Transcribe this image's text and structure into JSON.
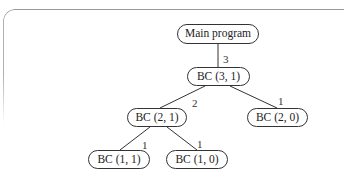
{
  "diagram": {
    "type": "call-tree",
    "nodes": [
      {
        "id": "main",
        "label": "Main program"
      },
      {
        "id": "bc31",
        "label": "BC (3, 1)"
      },
      {
        "id": "bc21",
        "label": "BC (2, 1)"
      },
      {
        "id": "bc20",
        "label": "BC (2, 0)"
      },
      {
        "id": "bc11",
        "label": "BC (1, 1)"
      },
      {
        "id": "bc10",
        "label": "BC (1, 0)"
      }
    ],
    "edges": [
      {
        "from": "main",
        "to": "bc31",
        "label": "3"
      },
      {
        "from": "bc31",
        "to": "bc21",
        "label": "2"
      },
      {
        "from": "bc31",
        "to": "bc20",
        "label": "1"
      },
      {
        "from": "bc21",
        "to": "bc11",
        "label": "1"
      },
      {
        "from": "bc21",
        "to": "bc10",
        "label": "1"
      }
    ],
    "colors": {
      "line": "#333333",
      "frame": "#9a9a9a",
      "background": "#ffffff"
    }
  }
}
